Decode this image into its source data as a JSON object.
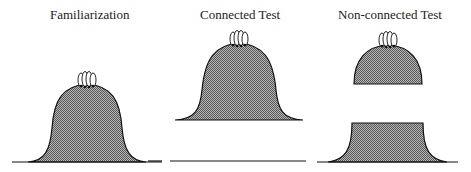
{
  "panels": [
    {
      "title": "Familiarization"
    },
    {
      "title": "Connected Test"
    },
    {
      "title": "Non-connected Test"
    }
  ],
  "colors": {
    "fill": "#8a8a8a",
    "stroke": "#111111",
    "finger": "#ffffff"
  }
}
